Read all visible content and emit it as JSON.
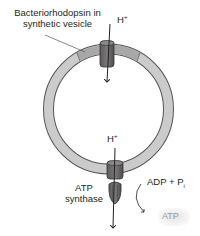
{
  "diagram": {
    "labels": {
      "bacteriorhodopsin_line1": "Bacteriorhodopsin in",
      "bacteriorhodopsin_line2": "synthetic vesicle",
      "h_plus_top": "H",
      "h_plus_top_sup": "+",
      "h_plus_bottom": "H",
      "h_plus_bottom_sup": "+",
      "atp_synthase_line1": "ATP",
      "atp_synthase_line2": "synthase",
      "adp_pi": "ADP + P",
      "adp_pi_sub": "i",
      "atp_product": "ATP"
    },
    "components": [
      {
        "name": "synthetic vesicle",
        "shape": "ring"
      },
      {
        "name": "bacteriorhodopsin",
        "position": "top of vesicle",
        "proton_flow": "into vesicle"
      },
      {
        "name": "ATP synthase",
        "position": "bottom of vesicle",
        "proton_flow": "out of vesicle"
      }
    ],
    "colors": {
      "membrane_fill": "#c8c8c8",
      "membrane_dark_segment": "#a9a9a9",
      "membrane_stroke": "#555555",
      "protein_fill": "#6b6b6b",
      "protein_stroke": "#333333",
      "arrow": "#231f20",
      "atp_text": "#9a9a9a"
    }
  }
}
